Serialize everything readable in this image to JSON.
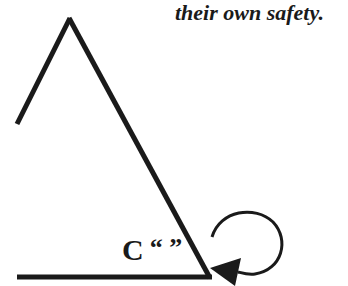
{
  "caption": "their own safety.",
  "diagram": {
    "label_letter": "C",
    "label_quotes": "“ ”",
    "shapes": [
      "triangle-outline",
      "baseline",
      "circular-arrow"
    ],
    "stroke_color": "#1a1a1a"
  }
}
